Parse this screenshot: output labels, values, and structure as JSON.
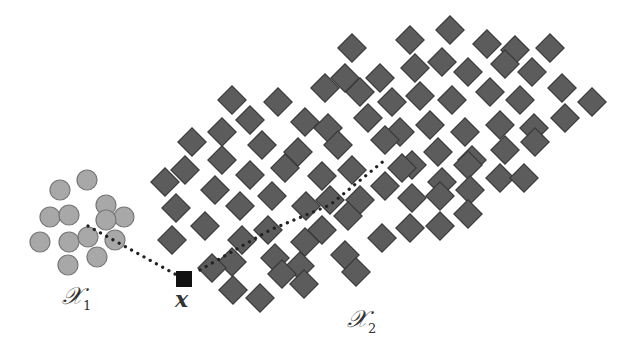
{
  "diagram": {
    "colors": {
      "diamond_fill": "#5c5c5c",
      "diamond_stroke": "#3a3a3a",
      "circle_fill": "#a8a8a8",
      "circle_stroke": "#777777",
      "query_fill": "#111111",
      "line": "#222222"
    },
    "labels": {
      "cluster1_main": "𝒳",
      "cluster1_sub": "1",
      "cluster2_main": "𝒳",
      "cluster2_sub": "2",
      "query": "x"
    },
    "query_point": {
      "x": 184,
      "y": 279
    },
    "cluster1_circles": [
      [
        60,
        190
      ],
      [
        87,
        180
      ],
      [
        50,
        217
      ],
      [
        69,
        215
      ],
      [
        106,
        205
      ],
      [
        124,
        217
      ],
      [
        40,
        242
      ],
      [
        69,
        242
      ],
      [
        88,
        237
      ],
      [
        106,
        220
      ],
      [
        115,
        240
      ],
      [
        97,
        257
      ],
      [
        68,
        265
      ]
    ],
    "cluster2_diamonds": [
      [
        352,
        48
      ],
      [
        410,
        40
      ],
      [
        450,
        30
      ],
      [
        487,
        44
      ],
      [
        515,
        50
      ],
      [
        550,
        48
      ],
      [
        345,
        78
      ],
      [
        380,
        78
      ],
      [
        415,
        68
      ],
      [
        442,
        62
      ],
      [
        468,
        72
      ],
      [
        505,
        64
      ],
      [
        532,
        72
      ],
      [
        232,
        100
      ],
      [
        278,
        102
      ],
      [
        325,
        88
      ],
      [
        360,
        92
      ],
      [
        392,
        102
      ],
      [
        420,
        96
      ],
      [
        452,
        100
      ],
      [
        490,
        92
      ],
      [
        520,
        100
      ],
      [
        562,
        88
      ],
      [
        592,
        102
      ],
      [
        250,
        120
      ],
      [
        305,
        122
      ],
      [
        328,
        128
      ],
      [
        368,
        118
      ],
      [
        400,
        132
      ],
      [
        430,
        125
      ],
      [
        465,
        132
      ],
      [
        500,
        125
      ],
      [
        534,
        128
      ],
      [
        565,
        118
      ],
      [
        192,
        142
      ],
      [
        222,
        132
      ],
      [
        262,
        145
      ],
      [
        298,
        152
      ],
      [
        338,
        145
      ],
      [
        385,
        140
      ],
      [
        412,
        165
      ],
      [
        438,
        152
      ],
      [
        472,
        160
      ],
      [
        505,
        150
      ],
      [
        535,
        142
      ],
      [
        165,
        182
      ],
      [
        185,
        170
      ],
      [
        222,
        160
      ],
      [
        250,
        175
      ],
      [
        285,
        168
      ],
      [
        322,
        176
      ],
      [
        352,
        170
      ],
      [
        402,
        168
      ],
      [
        442,
        182
      ],
      [
        468,
        165
      ],
      [
        500,
        178
      ],
      [
        524,
        178
      ],
      [
        176,
        208
      ],
      [
        215,
        190
      ],
      [
        240,
        206
      ],
      [
        272,
        196
      ],
      [
        306,
        206
      ],
      [
        330,
        200
      ],
      [
        360,
        200
      ],
      [
        385,
        186
      ],
      [
        412,
        198
      ],
      [
        440,
        196
      ],
      [
        470,
        190
      ],
      [
        172,
        240
      ],
      [
        205,
        226
      ],
      [
        242,
        240
      ],
      [
        268,
        230
      ],
      [
        305,
        242
      ],
      [
        322,
        230
      ],
      [
        348,
        216
      ],
      [
        382,
        238
      ],
      [
        410,
        228
      ],
      [
        440,
        226
      ],
      [
        468,
        214
      ],
      [
        232,
        262
      ],
      [
        275,
        258
      ],
      [
        300,
        266
      ],
      [
        345,
        255
      ],
      [
        212,
        268
      ],
      [
        233,
        290
      ],
      [
        260,
        298
      ],
      [
        282,
        274
      ],
      [
        304,
        284
      ],
      [
        356,
        272
      ]
    ],
    "dotted_paths": [
      [
        [
          88,
          226
        ],
        [
          184,
          279
        ]
      ],
      [
        [
          200,
          270
        ],
        [
          270,
          230
        ],
        [
          330,
          205
        ],
        [
          385,
          160
        ]
      ]
    ]
  }
}
